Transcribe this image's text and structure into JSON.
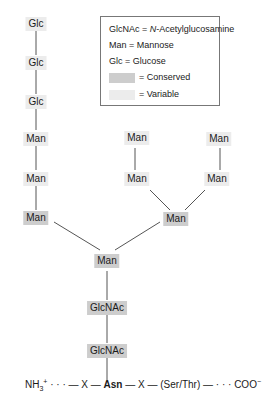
{
  "legend": {
    "glcnac": "GlcNAc = ",
    "glcnac_italic": "N",
    "glcnac_rest": "-Acetylglucosamine",
    "man": "Man = Mannose",
    "glc": "Glc = Glucose",
    "conserved": "= Conserved",
    "variable": "= Variable"
  },
  "colors": {
    "conserved": "#cdcdcd",
    "variable": "#ececec",
    "line": "#555555"
  },
  "nodes": {
    "glc1": "Glc",
    "glc2": "Glc",
    "glc3": "Glc",
    "man_l1": "Man",
    "man_l2": "Man",
    "man_l3": "Man",
    "man_m1": "Man",
    "man_m2": "Man",
    "man_r1": "Man",
    "man_r2": "Man",
    "man_branch": "Man",
    "man_core": "Man",
    "glcnac1": "GlcNAc",
    "glcnac2": "GlcNAc"
  },
  "sequence": {
    "nh3": "NH",
    "sub3": "3",
    "sup_plus": "+",
    "part1": " · · · — X — ",
    "asn": "Asn",
    "part2": " — X — (Ser/Thr) — · · · COO",
    "sup_minus": "−"
  }
}
